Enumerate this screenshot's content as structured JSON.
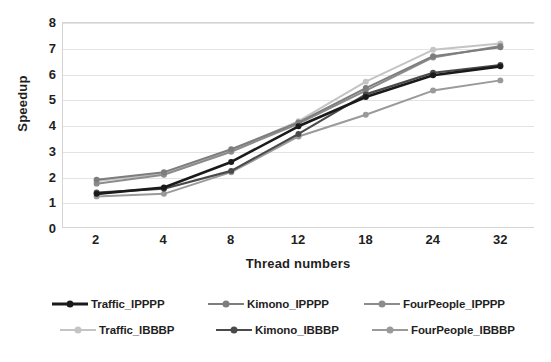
{
  "chart_data": {
    "type": "line",
    "title": "",
    "xlabel": "Thread numbers",
    "ylabel": "Speedup",
    "categories": [
      "2",
      "4",
      "8",
      "12",
      "18",
      "24",
      "32"
    ],
    "x": [
      2,
      4,
      8,
      12,
      18,
      24,
      32
    ],
    "ylim": [
      0,
      8
    ],
    "yticks": [
      "8",
      "7",
      "6",
      "5",
      "4",
      "3",
      "2",
      "1",
      "0"
    ],
    "ytick_values": [
      8,
      7,
      6,
      5,
      4,
      3,
      2,
      1,
      0
    ],
    "grid": true,
    "legend_position": "bottom",
    "series": [
      {
        "name": "Traffic_IPPPP",
        "color": "#1a1a1a",
        "width": 2.6,
        "values": [
          1.3,
          1.55,
          2.55,
          3.95,
          5.1,
          5.95,
          6.3
        ]
      },
      {
        "name": "Kimono_IPPPP",
        "color": "#7d7d7d",
        "width": 2.0,
        "values": [
          1.85,
          2.15,
          3.05,
          4.1,
          5.45,
          6.7,
          7.05
        ]
      },
      {
        "name": "FourPeople_IPPPP",
        "color": "#8c8c8c",
        "width": 2.0,
        "values": [
          1.7,
          2.05,
          2.95,
          4.05,
          5.35,
          6.65,
          7.1
        ]
      },
      {
        "name": "Traffic_IBBBP",
        "color": "#c4c4c4",
        "width": 2.0,
        "values": [
          1.8,
          2.1,
          3.0,
          4.15,
          5.7,
          6.95,
          7.2
        ]
      },
      {
        "name": "Kimono_IBBBP",
        "color": "#4a4a4a",
        "width": 2.2,
        "values": [
          1.35,
          1.5,
          2.2,
          3.65,
          5.2,
          6.05,
          6.35
        ]
      },
      {
        "name": "FourPeople_IBBBP",
        "color": "#9a9a9a",
        "width": 2.0,
        "values": [
          1.2,
          1.3,
          2.15,
          3.55,
          4.4,
          5.35,
          5.75
        ]
      }
    ]
  },
  "axes": {
    "y_title": "Speedup",
    "x_title": "Thread numbers"
  },
  "legend": {
    "rows": [
      [
        {
          "label": "Traffic_IPPPP",
          "color": "#1a1a1a"
        },
        {
          "label": "Kimono_IPPPP",
          "color": "#7d7d7d"
        },
        {
          "label": "FourPeople_IPPPP",
          "color": "#8c8c8c"
        }
      ],
      [
        {
          "label": "Traffic_IBBBP",
          "color": "#c4c4c4"
        },
        {
          "label": "Kimono_IBBBP",
          "color": "#4a4a4a"
        },
        {
          "label": "FourPeople_IBBBP",
          "color": "#9a9a9a"
        }
      ]
    ]
  },
  "colors": {
    "gridline": "#e3e3e3",
    "axis_border": "#d4d4d4",
    "text": "#1f1f1f",
    "background": "#ffffff"
  }
}
